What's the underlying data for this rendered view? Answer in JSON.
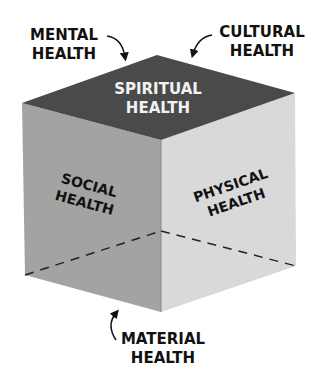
{
  "diagram": {
    "faces": {
      "top": {
        "line1": "SPIRITUAL",
        "line2": "HEALTH",
        "color": "#4a4a4a",
        "text_color": "#f2f2f2"
      },
      "left": {
        "line1": "SOCIAL",
        "line2": "HEALTH",
        "color": "#a3a3a3",
        "text_color": "#111111"
      },
      "right": {
        "line1": "PHYSICAL",
        "line2": "HEALTH",
        "color": "#d9d9d9",
        "text_color": "#111111"
      }
    },
    "callouts": {
      "mental": {
        "line1": "MENTAL",
        "line2": "HEALTH"
      },
      "cultural": {
        "line1": "CULTURAL",
        "line2": "HEALTH"
      },
      "material": {
        "line1": "MATERIAL",
        "line2": "HEALTH"
      }
    }
  }
}
